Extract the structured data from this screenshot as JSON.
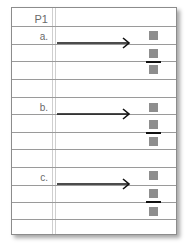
{
  "worksheet": {
    "header": "P1",
    "colors": {
      "rule_line": "#9a9a9a",
      "margin_line": "#cfcfcf",
      "square": "#8e8e8e",
      "arrow": "#111111",
      "label": "#6a6a6a"
    },
    "problems": [
      {
        "label": "a.",
        "answer": {
          "numerator_box": "",
          "denominator_box": "",
          "whole_box": ""
        }
      },
      {
        "label": "b.",
        "answer": {
          "numerator_box": "",
          "denominator_box": "",
          "whole_box": ""
        }
      },
      {
        "label": "c.",
        "answer": {
          "numerator_box": "",
          "denominator_box": "",
          "whole_box": ""
        }
      }
    ]
  }
}
